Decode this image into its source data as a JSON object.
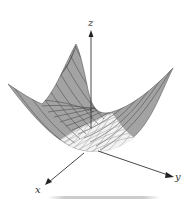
{
  "figure": {
    "title": "",
    "surface_type": "paraboloid",
    "axes": {
      "x_label": "x",
      "y_label": "y",
      "z_label": "z"
    },
    "colors": {
      "surface_outer": "#a3a3a3",
      "surface_inner": "#f2f2f2",
      "grid_lines": "#4a4a4a",
      "axis": "#333333",
      "shadow": "#c8c8c8"
    },
    "geometry": {
      "origin": [
        88,
        150
      ],
      "z_axis_tip": [
        91,
        32
      ],
      "x_axis_tip": [
        45,
        185
      ],
      "y_axis_tip": [
        174,
        177
      ],
      "surface_left_tip": [
        8,
        84
      ],
      "surface_back_peak": [
        76,
        44
      ],
      "surface_right_tip": [
        173,
        68
      ],
      "surface_bottom": [
        88,
        152
      ]
    }
  }
}
